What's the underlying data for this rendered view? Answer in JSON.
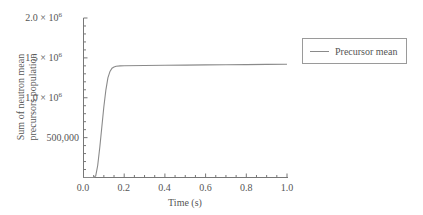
{
  "chart_data": {
    "type": "line",
    "title": "",
    "xlabel": "Time (s)",
    "ylabel": [
      "Sum of neutron mean",
      "precursors population"
    ],
    "xlim": [
      0.0,
      1.0
    ],
    "ylim": [
      0,
      2000000
    ],
    "x_ticks": [
      "0.0",
      "0.2",
      "0.4",
      "0.6",
      "0.8",
      "1.0"
    ],
    "y_ticks": [
      {
        "value": 500000,
        "label": "500,000"
      },
      {
        "value": 1000000,
        "label": "1.0 × 10^6"
      },
      {
        "value": 1500000,
        "label": "1.5 × 10^6"
      },
      {
        "value": 2000000,
        "label": "2.0 × 10^6"
      }
    ],
    "grid": false,
    "legend_position": "right",
    "series": [
      {
        "name": "Precursor mean",
        "color": "#8a8a8a",
        "x": [
          0.0,
          0.05,
          0.06,
          0.07,
          0.08,
          0.09,
          0.1,
          0.11,
          0.12,
          0.13,
          0.14,
          0.15,
          0.16,
          0.18,
          0.2,
          0.3,
          0.4,
          0.5,
          0.6,
          0.7,
          0.8,
          0.9,
          1.0
        ],
        "values": [
          0,
          0,
          20000,
          150000,
          380000,
          630000,
          880000,
          1100000,
          1250000,
          1330000,
          1370000,
          1385000,
          1395000,
          1400000,
          1402000,
          1405000,
          1408000,
          1410000,
          1412000,
          1414000,
          1416000,
          1418000,
          1420000
        ]
      }
    ]
  },
  "legend": {
    "items": [
      {
        "label": "Precursor mean"
      }
    ]
  },
  "axes": {
    "x_title": "Time (s)",
    "y_title_line1": "Sum of neutron mean",
    "y_title_line2": "precursors population",
    "x_tick_labels": [
      "0.0",
      "0.2",
      "0.4",
      "0.6",
      "0.8",
      "1.0"
    ],
    "y_tick_500k": "500,000",
    "y_tick_1m_mant": "1.0 × 10",
    "y_tick_15m_mant": "1.5 × 10",
    "y_tick_2m_mant": "2.0 × 10",
    "y_exp": "6"
  }
}
